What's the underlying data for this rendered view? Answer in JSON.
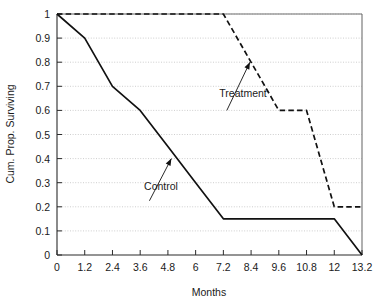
{
  "chart_data": {
    "type": "line",
    "title": "",
    "xlabel": "Months",
    "ylabel": "Cum. Prop. Surviving",
    "xlim": [
      0,
      13.2
    ],
    "ylim": [
      0,
      1
    ],
    "grid": true,
    "legend_position": "inline-annotations",
    "xticks": [
      "0",
      "1.2",
      "2.4",
      "3.6",
      "4.8",
      "6",
      "7.2",
      "8.4",
      "9.6",
      "10.8",
      "12",
      "13.2"
    ],
    "xtick_values": [
      0,
      1.2,
      2.4,
      3.6,
      4.8,
      6,
      7.2,
      8.4,
      9.6,
      10.8,
      12,
      13.2
    ],
    "yticks": [
      "0",
      "0.1",
      "0.2",
      "0.3",
      "0.4",
      "0.5",
      "0.6",
      "0.7",
      "0.8",
      "0.9",
      "1"
    ],
    "ytick_values": [
      0,
      0.1,
      0.2,
      0.3,
      0.4,
      0.5,
      0.6,
      0.7,
      0.8,
      0.9,
      1
    ],
    "series": [
      {
        "name": "Control",
        "style": "solid",
        "color": "#111111",
        "x": [
          0,
          1.2,
          2.4,
          3.6,
          4.8,
          6,
          7.2,
          12,
          13.2
        ],
        "values": [
          1.0,
          0.9,
          0.7,
          0.6,
          0.45,
          0.3,
          0.15,
          0.15,
          0.0
        ]
      },
      {
        "name": "Treatment",
        "style": "dashed",
        "color": "#111111",
        "x": [
          0,
          7.2,
          9.6,
          10.8,
          12,
          13.2
        ],
        "values": [
          1.0,
          1.0,
          0.6,
          0.6,
          0.2,
          0.2
        ]
      }
    ],
    "annotations": [
      {
        "text": "Treatment",
        "label_x": 8.05,
        "label_y": 0.655,
        "arrow_from_x": 7.35,
        "arrow_from_y": 0.6,
        "arrow_to_x": 8.35,
        "arrow_to_y": 0.8
      },
      {
        "text": "Control",
        "label_x": 4.5,
        "label_y": 0.27,
        "arrow_from_x": 4.0,
        "arrow_from_y": 0.225,
        "arrow_to_x": 4.95,
        "arrow_to_y": 0.4
      }
    ]
  }
}
